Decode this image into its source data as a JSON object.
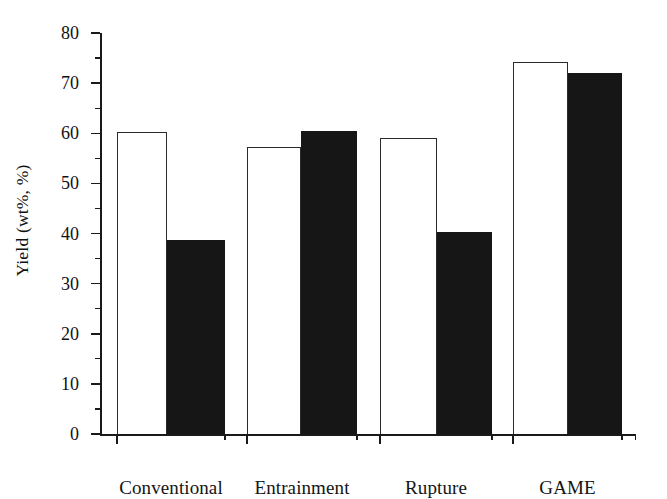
{
  "chart_data": {
    "type": "bar",
    "title": "",
    "subtitle": "",
    "xlabel": "",
    "ylabel": "Yield (wt%, %)",
    "categories": [
      "Conventional",
      "Entrainment",
      "Rupture",
      "GAME"
    ],
    "series": [
      {
        "name": "open-bar-series",
        "style": "white-outlined",
        "values": [
          60.2,
          57.2,
          59.0,
          74.2
        ]
      },
      {
        "name": "filled-bar-series",
        "style": "solid-black",
        "values": [
          38.8,
          60.4,
          40.3,
          72.0
        ]
      }
    ],
    "ylim": [
      0,
      80
    ],
    "ytick_labels": [
      "0",
      "10",
      "20",
      "30",
      "40",
      "50",
      "60",
      "70",
      "80"
    ],
    "ytick_values": [
      0,
      10,
      20,
      30,
      40,
      50,
      60,
      70,
      80
    ],
    "yminor_values": [
      5,
      15,
      25,
      35,
      45,
      55,
      65,
      75
    ],
    "grid": false,
    "legend": "none",
    "legend_position": "none",
    "annotations": []
  },
  "colors": {
    "background": "#ffffff",
    "axis": "#1a1a1a",
    "text": "#111111",
    "open_bar_fill": "#ffffff",
    "open_bar_stroke": "#2a2a2a",
    "filled_bar": "#161616"
  }
}
